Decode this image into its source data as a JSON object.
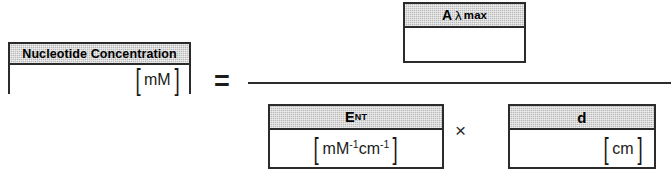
{
  "diagram": {
    "type": "formula",
    "operators": {
      "equals": "=",
      "times": "×",
      "bracket_left": "[",
      "bracket_right": "]"
    },
    "colors": {
      "header_fill": "#b9b9b9",
      "border": "#2b2b2b",
      "body_fill": "#ffffff",
      "text": "#000000"
    }
  },
  "left_term": {
    "header_label": "Nucleotide Concentration",
    "unit": "mM"
  },
  "numerator_term": {
    "header_main": "A",
    "header_lambda": "λ",
    "header_sub": "max",
    "unit": ""
  },
  "denominator": {
    "first_term": {
      "header_main": "E",
      "header_sub": "NT",
      "unit_base1": "mM",
      "unit_exp1": "-1",
      "unit_base2": "cm",
      "unit_exp2": "-1"
    },
    "second_term": {
      "header_main": "d",
      "unit": "cm"
    }
  }
}
